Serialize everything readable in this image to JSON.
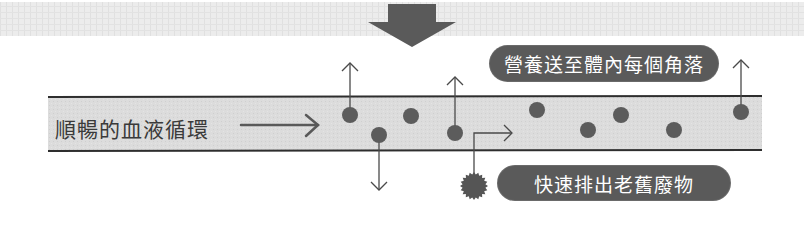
{
  "diagram": {
    "title_arrow": "down-arrow",
    "vessel_label": "順暢的血液循環",
    "callouts": {
      "nutrients": "營養送至體內每個角落",
      "waste": "快速排出老舊廢物"
    },
    "colors": {
      "band": "#d9d9d9",
      "band_border": "#2e2e2e",
      "dot": "#5c5c5c",
      "pill": "#5a5a5a",
      "arrow": "#595959",
      "top_strip": "#e6e6e6"
    },
    "particles": {
      "nutrient_dot_count": 9,
      "waste_particle_count": 1
    }
  }
}
